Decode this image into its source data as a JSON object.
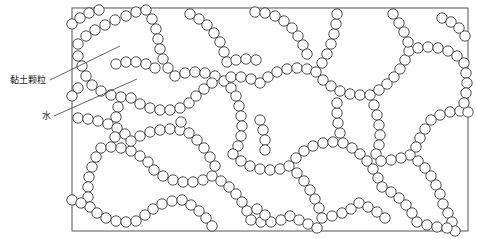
{
  "figure": {
    "type": "microstructure-schematic",
    "background_color": "#ffffff",
    "frame": {
      "x": 72,
      "y": 8,
      "width": 396,
      "height": 223,
      "stroke_color": "#555555",
      "stroke_width": 1,
      "fill": "#ffffff"
    },
    "particle": {
      "shape": "circle",
      "radius": 5.2,
      "stroke_color": "#3a3a3a",
      "stroke_width": 0.9,
      "fill": "#ffffff",
      "count": 430
    }
  },
  "annotations": {
    "clay": {
      "label": "黏土颗粒",
      "text_x": 10,
      "text_y": 75,
      "leader": {
        "x1": 50,
        "y1": 80,
        "x2": 120,
        "y2": 46
      }
    },
    "water": {
      "label": "水",
      "text_x": 42,
      "text_y": 111,
      "leader": {
        "x1": 54,
        "y1": 116,
        "x2": 137,
        "y2": 79
      }
    }
  },
  "chart_data": {
    "type": "scatter",
    "title": "",
    "xlabel": "",
    "ylabel": "",
    "grid": false,
    "legend": "none",
    "xlim": [
      72,
      468
    ],
    "ylim": [
      8,
      231
    ],
    "annotations": [
      "黏土颗粒",
      "水"
    ],
    "chains": [
      [
        [
          78,
          44
        ],
        [
          86,
          36
        ],
        [
          95,
          30
        ],
        [
          105,
          25
        ],
        [
          115,
          20
        ],
        [
          126,
          16
        ],
        [
          136,
          12
        ],
        [
          146,
          10
        ]
      ],
      [
        [
          78,
          56
        ],
        [
          82,
          66
        ],
        [
          86,
          76
        ],
        [
          92,
          85
        ],
        [
          101,
          91
        ],
        [
          111,
          95
        ],
        [
          121,
          97
        ],
        [
          131,
          98
        ]
      ],
      [
        [
          146,
          10
        ],
        [
          152,
          19
        ],
        [
          156,
          29
        ],
        [
          158,
          39
        ],
        [
          160,
          49
        ],
        [
          163,
          59
        ],
        [
          168,
          68
        ],
        [
          175,
          76
        ]
      ],
      [
        [
          131,
          98
        ],
        [
          140,
          104
        ],
        [
          150,
          108
        ],
        [
          160,
          110
        ],
        [
          170,
          110
        ],
        [
          180,
          108
        ],
        [
          189,
          103
        ],
        [
          196,
          96
        ]
      ],
      [
        [
          175,
          76
        ],
        [
          185,
          73
        ],
        [
          195,
          72
        ],
        [
          205,
          73
        ],
        [
          215,
          76
        ],
        [
          224,
          81
        ],
        [
          231,
          88
        ],
        [
          236,
          96
        ]
      ],
      [
        [
          196,
          96
        ],
        [
          204,
          89
        ],
        [
          212,
          83
        ],
        [
          221,
          79
        ],
        [
          231,
          77
        ],
        [
          241,
          77
        ],
        [
          251,
          79
        ],
        [
          260,
          83
        ]
      ],
      [
        [
          236,
          96
        ],
        [
          239,
          106
        ],
        [
          241,
          116
        ],
        [
          242,
          126
        ],
        [
          241,
          136
        ],
        [
          238,
          146
        ],
        [
          233,
          154
        ]
      ],
      [
        [
          260,
          83
        ],
        [
          268,
          77
        ],
        [
          277,
          72
        ],
        [
          287,
          69
        ],
        [
          297,
          68
        ],
        [
          307,
          69
        ],
        [
          316,
          72
        ]
      ],
      [
        [
          316,
          72
        ],
        [
          322,
          63
        ],
        [
          327,
          54
        ],
        [
          331,
          44
        ],
        [
          334,
          34
        ],
        [
          336,
          24
        ],
        [
          337,
          14
        ]
      ],
      [
        [
          316,
          72
        ],
        [
          323,
          80
        ],
        [
          331,
          86
        ],
        [
          340,
          91
        ],
        [
          350,
          94
        ],
        [
          360,
          95
        ],
        [
          370,
          95
        ]
      ],
      [
        [
          370,
          95
        ],
        [
          379,
          90
        ],
        [
          387,
          84
        ],
        [
          394,
          77
        ],
        [
          400,
          69
        ],
        [
          405,
          60
        ],
        [
          409,
          51
        ]
      ],
      [
        [
          370,
          95
        ],
        [
          374,
          105
        ],
        [
          377,
          115
        ],
        [
          379,
          125
        ],
        [
          380,
          135
        ],
        [
          379,
          145
        ],
        [
          376,
          154
        ]
      ],
      [
        [
          233,
          154
        ],
        [
          241,
          161
        ],
        [
          250,
          166
        ],
        [
          260,
          169
        ],
        [
          270,
          170
        ],
        [
          280,
          169
        ],
        [
          289,
          166
        ]
      ],
      [
        [
          289,
          166
        ],
        [
          297,
          173
        ],
        [
          304,
          181
        ],
        [
          310,
          190
        ],
        [
          315,
          199
        ],
        [
          319,
          208
        ],
        [
          322,
          218
        ]
      ],
      [
        [
          289,
          166
        ],
        [
          296,
          158
        ],
        [
          304,
          151
        ],
        [
          313,
          146
        ],
        [
          323,
          143
        ],
        [
          333,
          142
        ],
        [
          343,
          143
        ]
      ],
      [
        [
          343,
          143
        ],
        [
          352,
          148
        ],
        [
          360,
          154
        ],
        [
          367,
          161
        ],
        [
          373,
          169
        ],
        [
          378,
          178
        ],
        [
          382,
          187
        ]
      ],
      [
        [
          101,
          148
        ],
        [
          111,
          147
        ],
        [
          121,
          148
        ],
        [
          131,
          151
        ],
        [
          140,
          156
        ],
        [
          148,
          162
        ],
        [
          154,
          170
        ]
      ],
      [
        [
          154,
          170
        ],
        [
          163,
          176
        ],
        [
          173,
          180
        ],
        [
          183,
          182
        ],
        [
          193,
          182
        ],
        [
          203,
          180
        ],
        [
          212,
          176
        ]
      ],
      [
        [
          212,
          176
        ],
        [
          221,
          181
        ],
        [
          229,
          187
        ],
        [
          236,
          194
        ],
        [
          242,
          202
        ],
        [
          247,
          211
        ],
        [
          251,
          220
        ]
      ],
      [
        [
          101,
          148
        ],
        [
          96,
          157
        ],
        [
          92,
          167
        ],
        [
          89,
          177
        ],
        [
          88,
          187
        ],
        [
          88,
          197
        ],
        [
          90,
          207
        ]
      ],
      [
        [
          78,
          118
        ],
        [
          88,
          119
        ],
        [
          98,
          121
        ],
        [
          108,
          124
        ],
        [
          117,
          128
        ],
        [
          125,
          134
        ],
        [
          131,
          141
        ]
      ],
      [
        [
          131,
          141
        ],
        [
          140,
          136
        ],
        [
          150,
          132
        ],
        [
          160,
          130
        ],
        [
          170,
          129
        ],
        [
          180,
          130
        ],
        [
          189,
          133
        ]
      ],
      [
        [
          189,
          133
        ],
        [
          197,
          140
        ],
        [
          204,
          148
        ],
        [
          210,
          157
        ],
        [
          215,
          166
        ],
        [
          219,
          176
        ],
        [
          222,
          186
        ]
      ],
      [
        [
          410,
          155
        ],
        [
          418,
          161
        ],
        [
          425,
          168
        ],
        [
          431,
          176
        ],
        [
          436,
          185
        ],
        [
          440,
          194
        ],
        [
          443,
          204
        ]
      ],
      [
        [
          409,
          51
        ],
        [
          418,
          48
        ],
        [
          428,
          47
        ],
        [
          438,
          48
        ],
        [
          448,
          51
        ],
        [
          457,
          56
        ],
        [
          464,
          63
        ]
      ],
      [
        [
          431,
          120
        ],
        [
          440,
          115
        ],
        [
          450,
          112
        ],
        [
          460,
          111
        ],
        [
          468,
          112
        ]
      ],
      [
        [
          190,
          14
        ],
        [
          199,
          19
        ],
        [
          207,
          25
        ],
        [
          214,
          33
        ],
        [
          220,
          42
        ],
        [
          224,
          52
        ],
        [
          227,
          62
        ]
      ],
      [
        [
          255,
          12
        ],
        [
          265,
          13
        ],
        [
          275,
          16
        ],
        [
          284,
          21
        ],
        [
          292,
          28
        ],
        [
          298,
          36
        ]
      ],
      [
        [
          72,
          24
        ],
        [
          80,
          18
        ],
        [
          89,
          13
        ],
        [
          99,
          10
        ]
      ],
      [
        [
          393,
          14
        ],
        [
          399,
          23
        ],
        [
          404,
          32
        ],
        [
          408,
          42
        ]
      ],
      [
        [
          442,
          18
        ],
        [
          451,
          22
        ],
        [
          459,
          28
        ],
        [
          465,
          36
        ]
      ],
      [
        [
          88,
          207
        ],
        [
          97,
          213
        ],
        [
          106,
          218
        ],
        [
          116,
          221
        ],
        [
          126,
          222
        ],
        [
          136,
          221
        ]
      ],
      [
        [
          136,
          221
        ],
        [
          145,
          215
        ],
        [
          153,
          209
        ],
        [
          162,
          204
        ],
        [
          172,
          201
        ],
        [
          182,
          200
        ]
      ],
      [
        [
          251,
          220
        ],
        [
          261,
          222
        ],
        [
          271,
          222
        ],
        [
          281,
          220
        ],
        [
          290,
          216
        ]
      ],
      [
        [
          322,
          218
        ],
        [
          332,
          216
        ],
        [
          342,
          213
        ],
        [
          351,
          209
        ],
        [
          359,
          203
        ]
      ],
      [
        [
          382,
          187
        ],
        [
          391,
          192
        ],
        [
          399,
          198
        ],
        [
          406,
          205
        ],
        [
          412,
          213
        ],
        [
          417,
          222
        ]
      ],
      [
        [
          443,
          204
        ],
        [
          448,
          213
        ],
        [
          452,
          222
        ],
        [
          455,
          231
        ]
      ],
      [
        [
          222,
          186
        ],
        [
          231,
          191
        ],
        [
          240,
          197
        ],
        [
          248,
          204
        ]
      ],
      [
        [
          78,
          88
        ],
        [
          72,
          96
        ]
      ],
      [
        [
          410,
          155
        ],
        [
          401,
          158
        ],
        [
          391,
          160
        ],
        [
          381,
          161
        ]
      ],
      [
        [
          431,
          120
        ],
        [
          425,
          129
        ],
        [
          420,
          138
        ],
        [
          416,
          147
        ],
        [
          412,
          156
        ]
      ],
      [
        [
          343,
          143
        ],
        [
          340,
          133
        ],
        [
          338,
          123
        ],
        [
          337,
          113
        ],
        [
          337,
          103
        ]
      ],
      [
        [
          260,
          120
        ],
        [
          263,
          130
        ],
        [
          265,
          140
        ],
        [
          265,
          150
        ]
      ],
      [
        [
          196,
          96
        ],
        [
          190,
          104
        ],
        [
          185,
          113
        ],
        [
          181,
          122
        ],
        [
          179,
          132
        ]
      ],
      [
        [
          121,
          97
        ],
        [
          118,
          107
        ],
        [
          116,
          117
        ],
        [
          115,
          127
        ],
        [
          115,
          137
        ]
      ],
      [
        [
          464,
          63
        ],
        [
          466,
          73
        ],
        [
          467,
          83
        ],
        [
          466,
          93
        ],
        [
          464,
          103
        ]
      ],
      [
        [
          298,
          36
        ],
        [
          303,
          45
        ],
        [
          307,
          54
        ],
        [
          310,
          64
        ]
      ],
      [
        [
          227,
          62
        ],
        [
          236,
          60
        ],
        [
          246,
          59
        ],
        [
          256,
          60
        ]
      ],
      [
        [
          182,
          200
        ],
        [
          191,
          205
        ],
        [
          199,
          211
        ],
        [
          206,
          218
        ],
        [
          212,
          226
        ]
      ],
      [
        [
          290,
          216
        ],
        [
          299,
          220
        ],
        [
          308,
          224
        ],
        [
          317,
          228
        ]
      ],
      [
        [
          359,
          203
        ],
        [
          368,
          207
        ],
        [
          377,
          212
        ],
        [
          385,
          218
        ]
      ],
      [
        [
          417,
          222
        ],
        [
          427,
          225
        ],
        [
          437,
          227
        ],
        [
          447,
          228
        ]
      ],
      [
        [
          72,
          200
        ],
        [
          81,
          203
        ],
        [
          90,
          207
        ]
      ],
      [
        [
          248,
          204
        ],
        [
          257,
          209
        ],
        [
          265,
          215
        ]
      ],
      [
        [
          116,
          64
        ],
        [
          126,
          62
        ],
        [
          136,
          62
        ],
        [
          146,
          64
        ],
        [
          155,
          68
        ]
      ],
      [
        [
          155,
          68
        ],
        [
          160,
          58
        ],
        [
          163,
          48
        ],
        [
          164,
          38
        ]
      ]
    ]
  }
}
